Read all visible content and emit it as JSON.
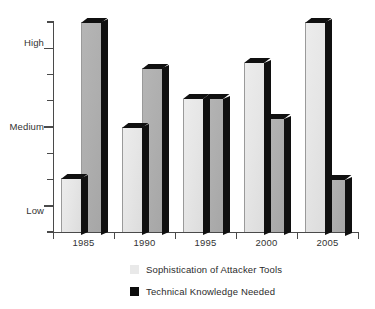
{
  "chart_data": {
    "type": "bar",
    "title": "",
    "subtitle": "",
    "xlabel": "",
    "ylabel": "",
    "categories": [
      "1985",
      "1990",
      "1995",
      "2000",
      "2005"
    ],
    "ytick_labels": [
      "Low",
      "Medium",
      "High"
    ],
    "ytick_values": [
      1,
      5,
      9
    ],
    "ylim": [
      0,
      10
    ],
    "grid": false,
    "legend_position": "bottom",
    "series": [
      {
        "name": "Sophistication of Attacker Tools",
        "color": "#e9e9e9",
        "values": [
          2.55,
          5.0,
          6.35,
          8.05,
          10.1
        ]
      },
      {
        "name": "Technical Knowledge Needed",
        "color": "#0d0d0d",
        "values": [
          10.7,
          7.8,
          6.35,
          5.4,
          2.5
        ]
      }
    ],
    "annotations": []
  },
  "axis": {
    "y_labels": [
      {
        "text": "High",
        "value": 9
      },
      {
        "text": "Medium",
        "value": 5
      },
      {
        "text": "Low",
        "value": 1
      }
    ],
    "x_labels": [
      "1985",
      "1990",
      "1995",
      "2000",
      "2005"
    ]
  },
  "legend": {
    "items": [
      {
        "label": "Sophistication of Attacker Tools",
        "swatch": "light-swatch-icon"
      },
      {
        "label": "Technical Knowledge Needed",
        "swatch": "dark-swatch-icon"
      }
    ]
  },
  "colors": {
    "light_bar": "#e9e9e9",
    "dark_bar": "#0d0d0d",
    "mid_bar": "#aeaeae",
    "axis": "#4a4a4a",
    "text": "#2b2b2b",
    "background": "#ffffff"
  }
}
